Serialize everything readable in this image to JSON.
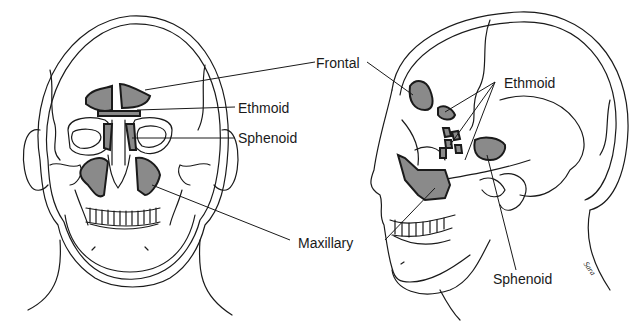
{
  "figure": {
    "views": [
      {
        "name": "frontal-view",
        "description": "Anterior view of head showing paranasal sinuses"
      },
      {
        "name": "lateral-view",
        "description": "Lateral view of head showing paranasal sinuses"
      }
    ],
    "labels": {
      "frontal": "Frontal",
      "ethmoid_front": "Ethmoid",
      "sphenoid_front": "Sphenoid",
      "maxillary": "Maxillary",
      "ethmoid_side": "Ethmoid",
      "sphenoid_side": "Sphenoid"
    },
    "signature": "Sara"
  },
  "colors": {
    "line": "#1a1a1a",
    "sinus_fill": "#8a8a8a",
    "background": "#ffffff"
  }
}
